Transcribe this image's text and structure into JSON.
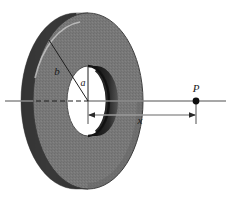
{
  "figure": {
    "background_color": "#ffffff",
    "width": 231,
    "height": 199,
    "labels": {
      "outer_radius": "b",
      "inner_radius": "a",
      "axial_distance": "x",
      "field_point": "P"
    },
    "colors": {
      "disk_face": "#787878",
      "disk_face_shadow": "#6e6e6e",
      "disk_rim_light": "#b4b4b4",
      "disk_rim_dark": "#1e1e1e",
      "hole_face": "#ffffff",
      "hole_bore_dark": "#141414",
      "axis_line": "#808080",
      "dimension_line": "#9a9a9a",
      "leader_line": "#262626",
      "point_marker": "#0d0d0d"
    },
    "geometry": {
      "disk_center_x": 88,
      "disk_center_y": 101,
      "outer_rx": 55,
      "outer_ry": 88,
      "inner_rx": 21,
      "inner_ry": 35,
      "axis_y": 101,
      "point_p_x": 196,
      "dimension_y": 115,
      "dimension_start_x": 88,
      "dimension_end_x": 196
    },
    "elements": [
      {
        "name": "outer-disk-body",
        "kind": "annulus-solid"
      },
      {
        "name": "inner-hole",
        "kind": "ellipse-hole"
      },
      {
        "name": "symmetry-axis",
        "kind": "line"
      },
      {
        "name": "hidden-axis-segment",
        "kind": "dashed-line"
      },
      {
        "name": "outer-radius-leader",
        "kind": "leader-line"
      },
      {
        "name": "inner-radius-leader",
        "kind": "leader-line"
      },
      {
        "name": "axial-distance-dimension",
        "kind": "dimension-line"
      },
      {
        "name": "field-point-p",
        "kind": "point-marker"
      }
    ]
  }
}
